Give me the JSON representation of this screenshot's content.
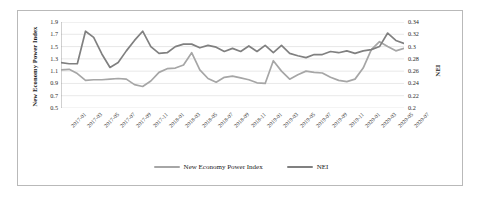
{
  "chart_data": {
    "type": "line",
    "title": "",
    "xlabel": "",
    "ylabel": "New Economy Power Index",
    "y2label": "NEI",
    "ylim": [
      0.5,
      1.9
    ],
    "y2lim": [
      0.2,
      0.34
    ],
    "grid": true,
    "legend_position": "bottom-center",
    "y_ticks": [
      "1.9",
      "1.7",
      "1.5",
      "1.3",
      "1.1",
      "0.9",
      "0.7",
      "0.5"
    ],
    "y2_ticks": [
      "0.34",
      "0.32",
      "0.3",
      "0.28",
      "0.26",
      "0.24",
      "0.22",
      "0.2"
    ],
    "x": [
      "2017-01",
      "2017-02",
      "2017-03",
      "2017-04",
      "2017-05",
      "2017-06",
      "2017-07",
      "2017-08",
      "2017-09",
      "2017-10",
      "2017-11",
      "2017-12",
      "2018-01",
      "2018-02",
      "2018-03",
      "2018-04",
      "2018-05",
      "2018-06",
      "2018-07",
      "2018-08",
      "2018-09",
      "2018-10",
      "2018-11",
      "2018-12",
      "2019-01",
      "2019-02",
      "2019-03",
      "2019-04",
      "2019-05",
      "2019-06",
      "2019-07",
      "2019-08",
      "2019-09",
      "2019-10",
      "2019-11",
      "2019-12",
      "2020-01",
      "2020-02",
      "2020-03",
      "2020-04",
      "2020-05",
      "2020-06",
      "2020-07"
    ],
    "x_tick_labels": [
      "2017-01",
      "2017-03",
      "2017-05",
      "2017-07",
      "2017-09",
      "2017-11",
      "2018-01",
      "2018-03",
      "2018-05",
      "2018-07",
      "2018-09",
      "2018-11",
      "2019-01",
      "2019-03",
      "2019-05",
      "2019-07",
      "2019-09",
      "2019-11",
      "2020-01",
      "2020-03",
      "2020-05",
      "2020-07"
    ],
    "series": [
      {
        "name": "New Economy Power Index",
        "axis": "left",
        "color": "#a6a6a6",
        "values": [
          1.12,
          1.13,
          1.06,
          0.95,
          0.96,
          0.96,
          0.97,
          0.98,
          0.97,
          0.88,
          0.85,
          0.94,
          1.08,
          1.14,
          1.15,
          1.2,
          1.4,
          1.12,
          0.98,
          0.92,
          1.0,
          1.02,
          0.99,
          0.96,
          0.91,
          0.9,
          1.27,
          1.1,
          0.97,
          1.04,
          1.1,
          1.08,
          1.07,
          1.0,
          0.95,
          0.93,
          0.97,
          1.15,
          1.45,
          1.58,
          1.5,
          1.43,
          1.47
        ]
      },
      {
        "name": "NEI",
        "axis": "right",
        "color": "#808080",
        "values": [
          0.274,
          0.272,
          0.272,
          0.325,
          0.315,
          0.288,
          0.266,
          0.274,
          0.293,
          0.31,
          0.325,
          0.3,
          0.289,
          0.29,
          0.3,
          0.304,
          0.304,
          0.298,
          0.302,
          0.299,
          0.292,
          0.297,
          0.292,
          0.301,
          0.292,
          0.302,
          0.29,
          0.302,
          0.289,
          0.285,
          0.282,
          0.287,
          0.287,
          0.292,
          0.29,
          0.293,
          0.289,
          0.293,
          0.295,
          0.3,
          0.322,
          0.31,
          0.305
        ]
      }
    ],
    "legend": [
      {
        "label": "New Economy Power Index",
        "color": "#a6a6a6"
      },
      {
        "label": "NEI",
        "color": "#808080"
      }
    ]
  }
}
